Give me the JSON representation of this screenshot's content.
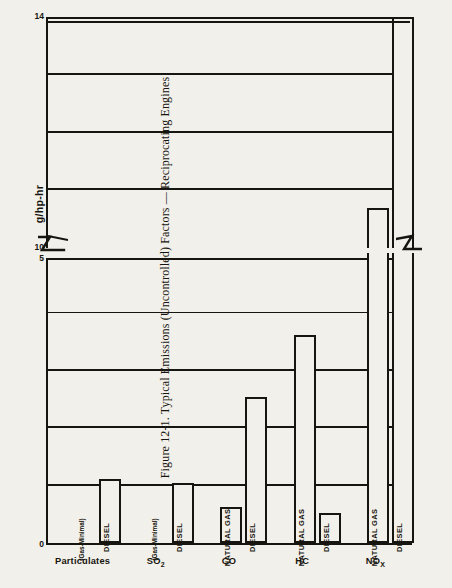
{
  "figure": {
    "caption": "Figure 12-1.  Typical Emissions (Uncontrolled) Factors — Reciprocating Engines"
  },
  "axis": {
    "y_label": "g/hp-hr",
    "tick_0": "0",
    "tick_5": "5",
    "tick_10": "10",
    "tick_14": "14"
  },
  "chart_data": {
    "type": "bar",
    "title": "Figure 12-1.  Typical Emissions (Uncontrolled) Factors — Reciprocating Engines",
    "xlabel": "",
    "ylabel": "g/hp-hr",
    "grid": true,
    "legend_position": "in-bar",
    "broken_axis": true,
    "lower_ylim": [
      0,
      5
    ],
    "upper_ylim": [
      10,
      14
    ],
    "lower_ticks": [
      0,
      1,
      2,
      3,
      4,
      5
    ],
    "lower_tick_labels": [
      "0",
      "",
      "",
      "",
      "",
      "5"
    ],
    "upper_ticks": [
      10,
      11,
      12,
      13,
      14
    ],
    "upper_tick_labels": [
      "10",
      "",
      "",
      "",
      "14"
    ],
    "categories": [
      "Particulates",
      "SO2",
      "CO",
      "HC",
      "NOx"
    ],
    "category_labels": [
      "Particulates",
      "SO₂",
      "CO",
      "HC",
      "NOₓ"
    ],
    "series": [
      {
        "name": "Natural Gas",
        "values": [
          0.0,
          0.0,
          0.62,
          3.62,
          10.7
        ],
        "bar_labels": [
          "(Gas-Minimal)",
          "(Gas-Minimal)",
          "NATURAL GAS",
          "NATURAL GAS",
          "NATURAL GAS"
        ]
      },
      {
        "name": "Diesel",
        "values": [
          1.12,
          1.05,
          2.55,
          0.52,
          14.0
        ],
        "bar_labels": [
          "DIESEL",
          "DIESEL",
          "DIESEL",
          "DIESEL",
          "DIESEL"
        ]
      }
    ]
  },
  "bars": [
    {
      "group": 0,
      "series": 0,
      "value": 0.0,
      "label": "(Gas-Minimal)",
      "small": true
    },
    {
      "group": 0,
      "series": 1,
      "value": 1.12,
      "label": "DIESEL",
      "small": false
    },
    {
      "group": 1,
      "series": 0,
      "value": 0.0,
      "label": "(Gas-Minimal)",
      "small": true
    },
    {
      "group": 1,
      "series": 1,
      "value": 1.05,
      "label": "DIESEL",
      "small": false
    },
    {
      "group": 2,
      "series": 0,
      "value": 0.62,
      "label": "NATURAL GAS",
      "small": false
    },
    {
      "group": 2,
      "series": 1,
      "value": 2.55,
      "label": "DIESEL",
      "small": false
    },
    {
      "group": 3,
      "series": 0,
      "value": 3.62,
      "label": "NATURAL GAS",
      "small": false
    },
    {
      "group": 3,
      "series": 1,
      "value": 0.52,
      "label": "DIESEL",
      "small": false
    },
    {
      "group": 4,
      "series": 0,
      "value": 10.7,
      "label": "NATURAL GAS",
      "small": false
    },
    {
      "group": 4,
      "series": 1,
      "value": 14.0,
      "label": "DIESEL",
      "small": false
    }
  ],
  "colors": {
    "ink": "#17150f",
    "paper": "#f2f0ea",
    "bar_fill": "#f2f0ea"
  }
}
